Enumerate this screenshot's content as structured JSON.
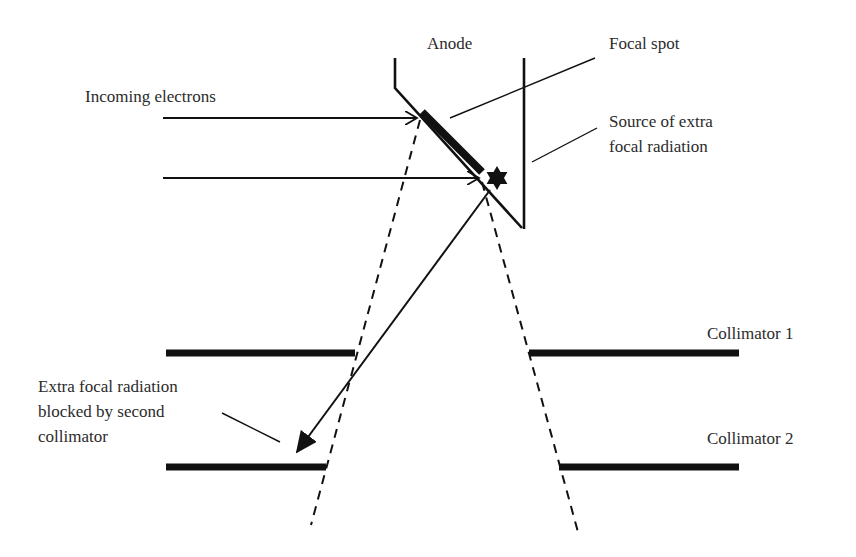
{
  "figure": {
    "type": "schematic",
    "colors": {
      "line": "#111111",
      "text": "#2b2b2b",
      "background": "#ffffff"
    }
  },
  "labels": {
    "anode": "Anode",
    "focal_spot": "Focal spot",
    "incoming_electrons": "Incoming electrons",
    "source_extra_focal": [
      "Source of extra",
      "focal radiation"
    ],
    "collimator_1": "Collimator 1",
    "collimator_2": "Collimator 2",
    "extra_focal_blocked": [
      "Extra focal radiation",
      "blocked by second",
      "collimator"
    ]
  },
  "icons": {
    "star": "star-icon (source of extra-focal radiation)"
  }
}
